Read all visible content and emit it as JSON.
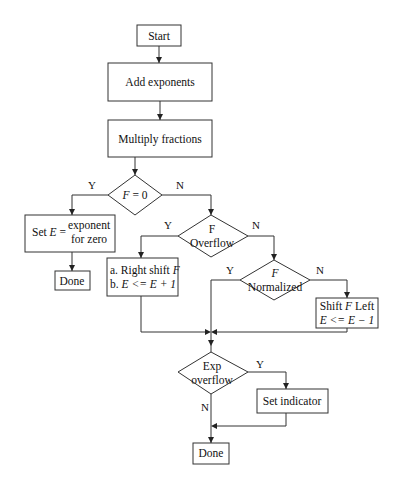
{
  "diagram": {
    "type": "flowchart",
    "title": "",
    "nodes": {
      "start": {
        "label": "Start"
      },
      "add_exponents": {
        "label": "Add exponents"
      },
      "multiply_fractions": {
        "label": "Multiply fractions"
      },
      "f_zero": {
        "label_var": "F",
        "label_rest": " = 0"
      },
      "set_e": {
        "label_prefix": "Set ",
        "label_var": "E",
        "label_eq": " =",
        "label_line1": "exponent",
        "label_line2": "for zero"
      },
      "done_zero": {
        "label": "Done"
      },
      "f_overflow": {
        "label_line1": "F",
        "label_line2": "Overflow"
      },
      "right_shift": {
        "line1_prefix": "a. Right shift ",
        "line1_var": "F",
        "line2_prefix": "b. ",
        "line2_expr": "E <= E + 1"
      },
      "f_normalized": {
        "label_line1": "F",
        "label_line2": "Normalized"
      },
      "shift_left": {
        "line1_prefix": "Shift ",
        "line1_var": "F",
        "line1_suffix": " Left",
        "line2_expr": "E <= E − 1"
      },
      "exp_overflow": {
        "label_line1": "Exp",
        "label_line2": "overflow"
      },
      "set_indicator": {
        "label": "Set indicator"
      },
      "done_final": {
        "label": "Done"
      }
    },
    "edge_labels": {
      "f_zero_yes": "Y",
      "f_zero_no": "N",
      "overflow_yes": "Y",
      "overflow_no": "N",
      "normalized_yes": "Y",
      "normalized_no": "N",
      "exp_overflow_yes": "Y",
      "exp_overflow_no": "N"
    },
    "colors": {
      "stroke": "#333333",
      "background": "#ffffff",
      "text": "#111111"
    }
  }
}
